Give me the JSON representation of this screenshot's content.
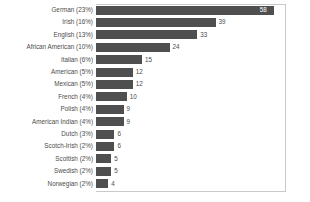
{
  "chart_data": {
    "type": "bar",
    "orientation": "horizontal",
    "title": "",
    "subtitle": "",
    "xlabel": "",
    "ylabel": "",
    "xlim": [
      0,
      62
    ],
    "grid": false,
    "legend": null,
    "bar_color": "#4f4f4f",
    "label_color": "#4c4c4c",
    "background_color": "#ffffff",
    "frame_color": "#c9c9c9",
    "categories": [
      "German (23%)",
      "Irish (16%)",
      "English (13%)",
      "African American (10%)",
      "Italian (6%)",
      "American (5%)",
      "Mexican (5%)",
      "French (4%)",
      "Polish (4%)",
      "American Indian (4%)",
      "Dutch (3%)",
      "Scotch-Irish (2%)",
      "Scottish (2%)",
      "Swedish (2%)",
      "Norwegian (2%)"
    ],
    "values": [
      58,
      39,
      33,
      24,
      15,
      12,
      12,
      10,
      9,
      9,
      6,
      6,
      5,
      5,
      4
    ],
    "value_labels": [
      "58",
      "39",
      "33",
      "24",
      "15",
      "12",
      "12",
      "10",
      "9",
      "9",
      "6",
      "6",
      "5",
      "5",
      "4"
    ],
    "value_label_inside": [
      true,
      false,
      false,
      false,
      false,
      false,
      false,
      false,
      false,
      false,
      false,
      false,
      false,
      false,
      false
    ]
  }
}
